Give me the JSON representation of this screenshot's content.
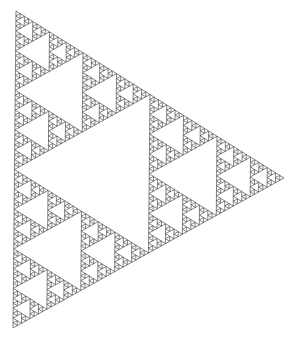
{
  "figure": {
    "name": "Sierpinski triangle",
    "orientation": "pointing-right",
    "depth": 6,
    "vertices": [
      [
        16,
        11
      ],
      [
        13,
        328
      ],
      [
        284,
        178
      ]
    ],
    "stroke_color": "#333333",
    "fill_color": "#ffffff",
    "background": "#ffffff",
    "stroke_width": 0.6
  }
}
